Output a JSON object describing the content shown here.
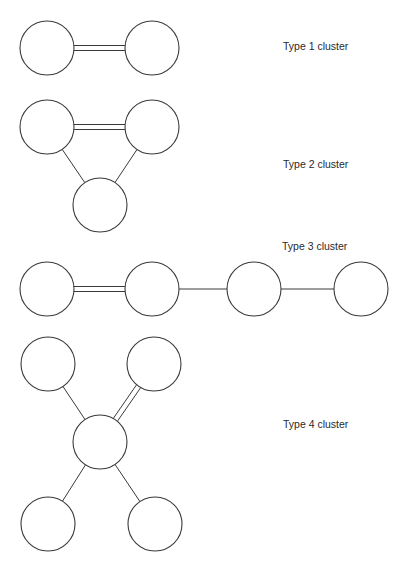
{
  "diagram": {
    "stroke_color": "#3a3a3a",
    "node_radius": 27,
    "clusters": [
      {
        "label": "Type 1 cluster",
        "label_pos": [
          283,
          40
        ],
        "nodes": [
          [
            47,
            48
          ],
          [
            152,
            48
          ]
        ],
        "bonds": [
          {
            "from": 0,
            "to": 1,
            "type": "double"
          }
        ]
      },
      {
        "label": "Type 2 cluster",
        "label_pos": [
          283,
          158
        ],
        "nodes": [
          [
            47,
            127
          ],
          [
            152,
            127
          ],
          [
            100,
            205
          ]
        ],
        "bonds": [
          {
            "from": 0,
            "to": 1,
            "type": "double"
          },
          {
            "from": 0,
            "to": 2,
            "type": "single"
          },
          {
            "from": 1,
            "to": 2,
            "type": "single"
          }
        ]
      },
      {
        "label": "Type 3 cluster",
        "label_pos": [
          282,
          240
        ],
        "nodes": [
          [
            47,
            289
          ],
          [
            152,
            289
          ],
          [
            254,
            289
          ],
          [
            361,
            289
          ]
        ],
        "bonds": [
          {
            "from": 0,
            "to": 1,
            "type": "double"
          },
          {
            "from": 1,
            "to": 2,
            "type": "single"
          },
          {
            "from": 2,
            "to": 3,
            "type": "single"
          }
        ]
      },
      {
        "label": "Type 4 cluster",
        "label_pos": [
          283,
          418
        ],
        "nodes": [
          [
            48,
            364
          ],
          [
            154,
            364
          ],
          [
            100,
            442
          ],
          [
            48,
            524
          ],
          [
            155,
            524
          ]
        ],
        "bonds": [
          {
            "from": 0,
            "to": 2,
            "type": "single"
          },
          {
            "from": 1,
            "to": 2,
            "type": "double"
          },
          {
            "from": 2,
            "to": 3,
            "type": "single"
          },
          {
            "from": 2,
            "to": 4,
            "type": "single"
          }
        ]
      }
    ]
  }
}
